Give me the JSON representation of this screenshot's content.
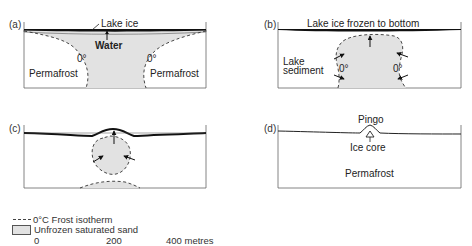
{
  "figure": {
    "colors": {
      "sand_fill": "#e2e2e2",
      "ice": "#111111",
      "outline": "#555555",
      "isotherm": "#333333"
    },
    "panels": [
      {
        "id": "a",
        "label": "(a)",
        "annotations": {
          "ice": "Lake ice",
          "water": "Water",
          "isotherm_left": "0°",
          "isotherm_right": "0°",
          "left_region": "Permafrost",
          "right_region": "Permafrost"
        }
      },
      {
        "id": "b",
        "label": "(b)",
        "annotations": {
          "ice": "Lake ice frozen to bottom",
          "sediment_line1": "Lake",
          "sediment_line2": "sediment",
          "isotherm_left": "0°",
          "isotherm_right": "0°"
        }
      },
      {
        "id": "c",
        "label": "(c)",
        "annotations": {}
      },
      {
        "id": "d",
        "label": "(d)",
        "annotations": {
          "mound": "Pingo",
          "core": "Ice core",
          "region": "Permafrost"
        }
      }
    ]
  },
  "legend": {
    "isotherm": "0°C Frost  isotherm",
    "sand": "Unfrozen saturated sand",
    "scale": [
      "0",
      "200",
      "400 metres"
    ]
  }
}
